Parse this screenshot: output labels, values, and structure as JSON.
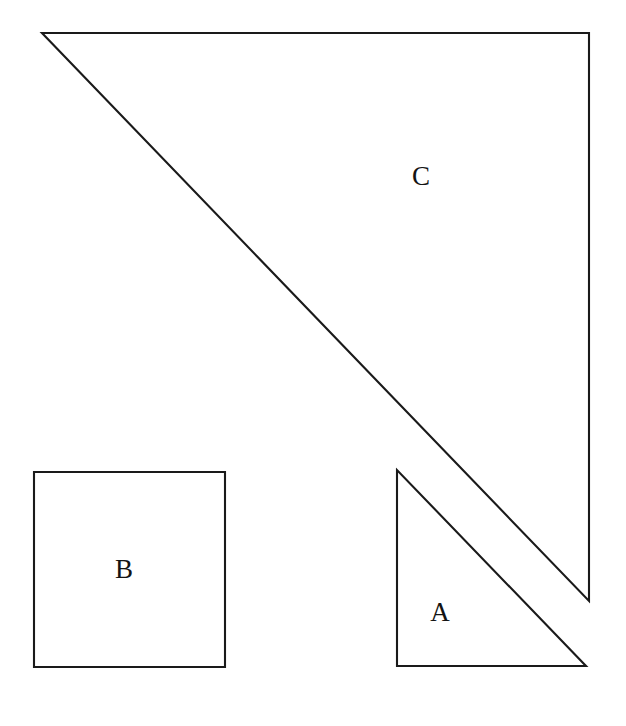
{
  "figure": {
    "canvas": {
      "width": 626,
      "height": 726
    },
    "background_color": "#ffffff",
    "stroke_color": "#1a1a1a",
    "stroke_width": 2.1,
    "label_color": "#141414",
    "label_font_size": 27
  },
  "shapes": [
    {
      "id": "triangle-c",
      "label": "C",
      "kind": "right-triangle",
      "points": "42,33 589,33 589,601",
      "label_x": 421,
      "label_y": 179,
      "right_angle_at": "top-right",
      "legs": {
        "horizontal": 547,
        "vertical": 568
      }
    },
    {
      "id": "triangle-a",
      "label": "A",
      "kind": "right-triangle",
      "points": "397,470 397,666 586,666",
      "label_x": 440,
      "label_y": 615,
      "right_angle_at": "bottom-left",
      "legs": {
        "horizontal": 189,
        "vertical": 196
      }
    },
    {
      "id": "square-b",
      "label": "B",
      "kind": "square",
      "x": 34,
      "y": 472,
      "width": 191,
      "height": 195,
      "label_x": 124,
      "label_y": 572
    }
  ],
  "chart_data": {
    "type": "diagram",
    "xlabel": "",
    "ylabel": "",
    "grid": false,
    "legend": false,
    "units": "pixels",
    "elements": [
      {
        "name": "C",
        "type": "right triangle",
        "vertices": [
          [
            42,
            33
          ],
          [
            589,
            33
          ],
          [
            589,
            601
          ]
        ],
        "leg_horizontal": 547,
        "leg_vertical": 568,
        "label_position": [
          421,
          179
        ]
      },
      {
        "name": "A",
        "type": "right triangle",
        "vertices": [
          [
            397,
            470
          ],
          [
            397,
            666
          ],
          [
            586,
            666
          ]
        ],
        "leg_horizontal": 189,
        "leg_vertical": 196,
        "label_position": [
          440,
          615
        ]
      },
      {
        "name": "B",
        "type": "square",
        "vertices": [
          [
            34,
            472
          ],
          [
            225,
            472
          ],
          [
            225,
            667
          ],
          [
            34,
            667
          ]
        ],
        "side": 191,
        "label_position": [
          124,
          572
        ]
      }
    ],
    "annotations": [
      "A",
      "B",
      "C"
    ]
  }
}
